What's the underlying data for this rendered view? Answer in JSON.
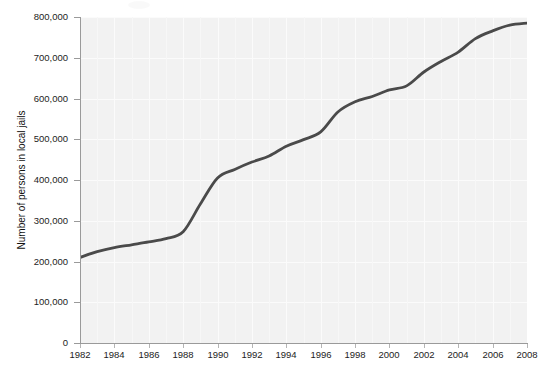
{
  "chart_data": {
    "type": "line",
    "title": "",
    "xlabel": "",
    "ylabel": "Number of persons in local jails",
    "xlim": [
      1982,
      2008
    ],
    "ylim": [
      0,
      800000
    ],
    "grid": true,
    "legend": "none",
    "x_ticks": [
      "1982",
      "1984",
      "1986",
      "1988",
      "1990",
      "1992",
      "1994",
      "1996",
      "1998",
      "2000",
      "2002",
      "2004",
      "2006",
      "2008"
    ],
    "x_tick_values": [
      1982,
      1984,
      1986,
      1988,
      1990,
      1992,
      1994,
      1996,
      1998,
      2000,
      2002,
      2004,
      2006,
      2008
    ],
    "y_ticks": [
      "0",
      "100,000",
      "200,000",
      "300,000",
      "400,000",
      "500,000",
      "600,000",
      "700,000",
      "800,000"
    ],
    "y_tick_values": [
      0,
      100000,
      200000,
      300000,
      400000,
      500000,
      600000,
      700000,
      800000
    ],
    "series": [
      {
        "name": "Number of persons in local jails",
        "color": "#4a4a4a",
        "x": [
          1982,
          1983,
          1984,
          1985,
          1986,
          1987,
          1988,
          1989,
          1990,
          1991,
          1992,
          1993,
          1994,
          1995,
          1996,
          1997,
          1998,
          1999,
          2000,
          2001,
          2002,
          2003,
          2004,
          2005,
          2006,
          2007,
          2008
        ],
        "values": [
          210000,
          224000,
          234000,
          241000,
          248000,
          256000,
          273000,
          341000,
          405000,
          426000,
          444000,
          459000,
          483000,
          499000,
          518000,
          567000,
          592000,
          605000,
          621000,
          631000,
          665000,
          691000,
          714000,
          747000,
          766000,
          780000,
          785000
        ]
      }
    ]
  },
  "axis": {
    "y_title": "Number of persons in local jails"
  },
  "colors": {
    "line": "#4a4a4a",
    "plot_background": "#f2f2f2",
    "gridline": "#fbfbfb",
    "axis": "#9a9a9a",
    "text": "#1d1d1d",
    "page_background": "#ffffff"
  }
}
